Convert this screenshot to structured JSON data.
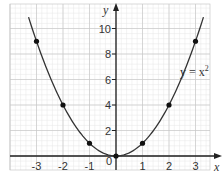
{
  "chart_data": {
    "type": "line",
    "title": "",
    "equation_label": "y = x²",
    "equation_base": "y = x",
    "equation_exp": "2",
    "xlabel": "x",
    "ylabel": "y",
    "xlim": [
      -3.5,
      3.5
    ],
    "ylim": [
      0,
      11
    ],
    "grid": true,
    "x_ticks": [
      "-3",
      "-2",
      "-1",
      "0",
      "1",
      "2",
      "3"
    ],
    "y_ticks": [
      "2",
      "4",
      "6",
      "8",
      "10"
    ],
    "series": [
      {
        "name": "y = x^2",
        "curve": "parabola",
        "points": [
          {
            "x": -3,
            "y": 9
          },
          {
            "x": -2,
            "y": 4
          },
          {
            "x": -1,
            "y": 1
          },
          {
            "x": 0,
            "y": 0
          },
          {
            "x": 1,
            "y": 1
          },
          {
            "x": 2,
            "y": 4
          },
          {
            "x": 3,
            "y": 9
          }
        ]
      }
    ]
  },
  "colors": {
    "grid_minor": "#e6e6e6",
    "grid_major": "#c8c8c8",
    "axis": "#222222",
    "curve": "#333333",
    "point": "#111111"
  }
}
